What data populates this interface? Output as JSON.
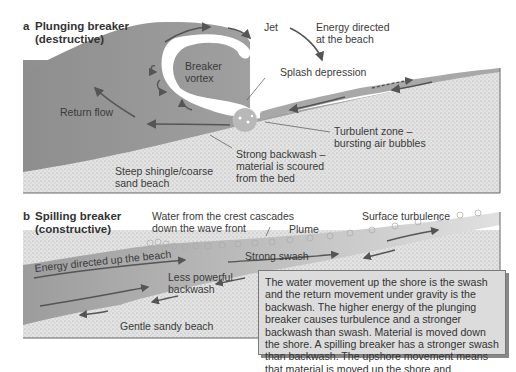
{
  "panel_a": {
    "letter": "a",
    "title_line1": "Plunging breaker",
    "title_line2": "(destructive)",
    "labels": {
      "jet": "Jet",
      "energy_line1": "Energy directed",
      "energy_line2": "at the beach",
      "vortex_line1": "Breaker",
      "vortex_line2": "vortex",
      "splash": "Splash depression",
      "return_flow": "Return flow",
      "turbulent_line1": "Turbulent zone –",
      "turbulent_line2": "bursting air bubbles",
      "backwash_line1": "Strong backwash –",
      "backwash_line2": "material is scoured",
      "backwash_line3": "from the bed",
      "beach_line1": "Steep shingle/coarse",
      "beach_line2": "sand beach"
    }
  },
  "panel_b": {
    "letter": "b",
    "title_line1": "Spilling breaker",
    "title_line2": "(constructive)",
    "labels": {
      "crest_line1": "Water from the crest cascades",
      "crest_line2": "down the wave front",
      "plume": "Plume",
      "surface": "Surface turbulence",
      "energy": "Energy directed up the beach",
      "strong_swash": "Strong swash",
      "less_line1": "Less powerful",
      "less_line2": "backwash",
      "beach": "Gentle sandy beach"
    }
  },
  "note": {
    "text": "The water movement up the shore is the swash and the return movement under gravity is the backwash. The higher energy of the plunging breaker causes turbulence and a stronger backwash than swash. Material is moved down the shore. A spilling breaker has a stronger swash than backwash. The upshore movement means that material is moved up the shore and deposited."
  },
  "colors": {
    "water": "#9a9a9a",
    "water_light": "#c8c8c8",
    "sand": "#d6d6d6",
    "arrow": "#555555",
    "note_bg": "#dcdcdc"
  }
}
